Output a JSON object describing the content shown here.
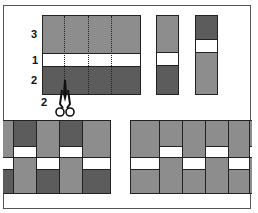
{
  "colors": {
    "light_grey": "#8d8d8d",
    "dark_grey": "#5c5c5c",
    "white": "#ffffff",
    "outline": "#222222",
    "frame": "#555555"
  },
  "labels": {
    "row_top": "3",
    "row_middle": "1",
    "row_bottom": "2",
    "cut_width": "2"
  },
  "main_block": {
    "rows": [
      {
        "label": "3",
        "color": "light_grey"
      },
      {
        "label": "1",
        "color": "white"
      },
      {
        "label": "2",
        "color": "dark_grey"
      }
    ],
    "cut_lines": 3
  },
  "strips": [
    {
      "name": "strip-a",
      "segments": [
        "light_grey",
        "white",
        "dark_grey"
      ]
    },
    {
      "name": "strip-b",
      "segments": [
        "dark_grey",
        "white",
        "light_grey"
      ]
    }
  ],
  "icons": {
    "scissors": "scissors-icon"
  }
}
